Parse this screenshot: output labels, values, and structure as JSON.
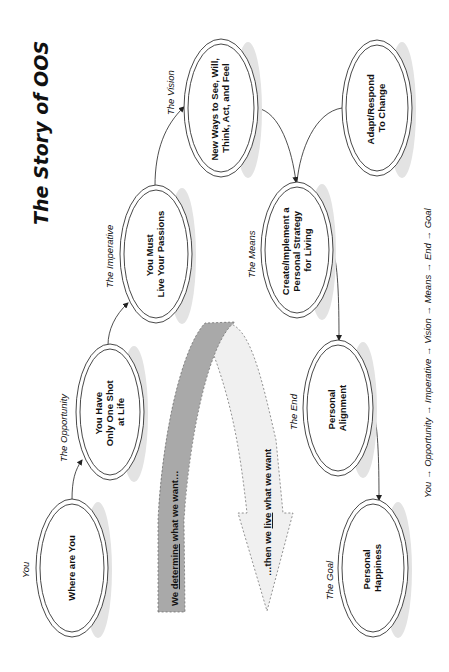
{
  "title": "The Story of OOS",
  "nodes": [
    {
      "id": "you",
      "stage": "You",
      "line1": "Where are You",
      "line2": "",
      "line3": ""
    },
    {
      "id": "opportunity",
      "stage": "The Opportunity",
      "line1": "You Have",
      "line2": "Only One Shot",
      "line3": "at Life"
    },
    {
      "id": "imperative",
      "stage": "The Imperative",
      "line1": "You Must",
      "line2": "Live Your Passions",
      "line3": ""
    },
    {
      "id": "vision",
      "stage": "The Vision",
      "line1": "New Ways to See, Will,",
      "line2": "Think, Act, and Feel",
      "line3": ""
    },
    {
      "id": "adapt",
      "stage": "",
      "line1": "Adapt/Respond",
      "line2": "To Change",
      "line3": ""
    },
    {
      "id": "means",
      "stage": "The Means",
      "line1": "Create/Implement a",
      "line2": "Personal Strategy",
      "line3": "for Living"
    },
    {
      "id": "end",
      "stage": "The End",
      "line1": "Personal",
      "line2": "Alignment",
      "line3": ""
    },
    {
      "id": "goal",
      "stage": "The Goal",
      "line1": "Personal",
      "line2": "Happiness",
      "line3": ""
    }
  ],
  "band": {
    "determine_pre": "We ",
    "determine_key": "determine",
    "determine_post": " what we want…",
    "live_pre": "…then we ",
    "live_key": "live",
    "live_post": " what we want"
  },
  "footer": "You → Opportunity → Imperative → Vision → Means → End → Goal",
  "colors": {
    "band_dark": "#a9a9a9",
    "band_light": "#f0f0f0",
    "shadow": "#e3e3e3"
  }
}
